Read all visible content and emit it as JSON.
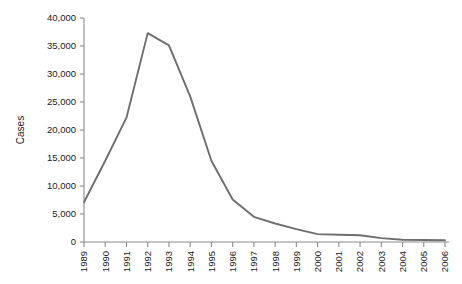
{
  "chart_data": {
    "type": "line",
    "title": "",
    "subtitle": "",
    "xlabel": "",
    "ylabel": "Cases",
    "categories": [
      "1989",
      "1990",
      "1991",
      "1992",
      "1993",
      "1994",
      "1995",
      "1996",
      "1997",
      "1998",
      "1999",
      "2000",
      "2001",
      "2002",
      "2003",
      "2004",
      "2005",
      "2006"
    ],
    "values": [
      7100,
      14500,
      22200,
      37300,
      35100,
      26000,
      14500,
      7600,
      4500,
      3300,
      2300,
      1400,
      1300,
      1200,
      700,
      400,
      350,
      300
    ],
    "series": [
      {
        "name": "Cases",
        "color": "#6e6e6e",
        "values": [
          7100,
          14500,
          22200,
          37300,
          35100,
          26000,
          14500,
          7600,
          4500,
          3300,
          2300,
          1400,
          1300,
          1200,
          700,
          400,
          350,
          300
        ]
      }
    ],
    "ylim": [
      0,
      40000
    ],
    "ytick_values": [
      0,
      5000,
      10000,
      15000,
      20000,
      25000,
      30000,
      35000,
      40000
    ],
    "ytick_labels": [
      "0",
      "5,000",
      "10,000",
      "15,000",
      "20,000",
      "25,000",
      "30,000",
      "35,000",
      "40,000"
    ],
    "xtick_labels": [
      "1989",
      "1990",
      "1991",
      "1992",
      "1993",
      "1994",
      "1995",
      "1996",
      "1997",
      "1998",
      "1999",
      "2000",
      "2001",
      "2002",
      "2003",
      "2004",
      "2005",
      "2006"
    ],
    "xtick_rotation": -90,
    "grid": false,
    "legend": false,
    "legend_position": "none",
    "annotations": []
  },
  "colors": {
    "line": "#6e6e6e",
    "axis": "#8a8a8a",
    "text": "#1a1a1a",
    "background": "#ffffff"
  }
}
